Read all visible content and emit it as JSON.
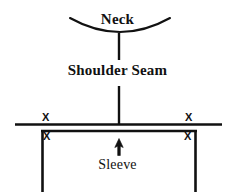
{
  "diagram": {
    "labels": {
      "neck": "Neck",
      "shoulder_seam": "Shoulder Seam",
      "sleeve": "Sleeve"
    },
    "marks": {
      "x_symbol": "X",
      "x_top_left": "X",
      "x_top_right": "X",
      "x_inner_left": "X",
      "x_inner_right": "X"
    },
    "colors": {
      "ink": "#111111",
      "background": "#ffffff"
    },
    "icons": {
      "arrow": "arrow-up-icon",
      "neck_curve": "neck-arc-icon"
    },
    "geometry": {
      "neck_arc": "M 70 18 Q 120 45 170 18",
      "neck_stem": {
        "x": 119,
        "y1": 33,
        "y2": 60
      },
      "shoulder_stem": {
        "x": 119,
        "y1": 86,
        "y2": 124
      },
      "shoulder_line": {
        "x1": 15,
        "x2": 222,
        "y": 124
      },
      "sleeve_rect": {
        "x": 42,
        "y": 130,
        "width": 154,
        "height": 62
      },
      "arrow": {
        "x": 119,
        "y_tip": 139,
        "y_tail": 155
      }
    }
  }
}
